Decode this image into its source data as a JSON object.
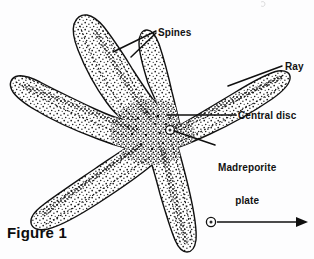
{
  "figure": {
    "caption": "Figure 1",
    "background_color": "#fdfdfe",
    "ink_color": "#111111"
  },
  "labels": [
    {
      "id": "spines",
      "text": "Spines",
      "leader": "double-line-v"
    },
    {
      "id": "ray",
      "text": "Ray",
      "leader": "single-line"
    },
    {
      "id": "central_disc",
      "text": "Central disc",
      "leader": "single-line"
    },
    {
      "id": "madreporite",
      "line1": "Madreporite",
      "line2": "plate",
      "leader": "single-line"
    }
  ],
  "annotations": {
    "unlabeled_arrow": {
      "name": "eyespot-pointer-arrow",
      "direction": "right",
      "origin": "bottom-ray-tip-circle"
    }
  }
}
